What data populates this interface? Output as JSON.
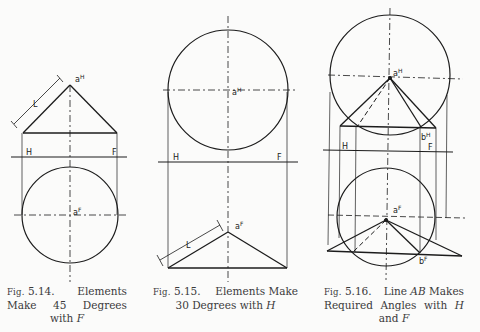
{
  "figures": [
    {
      "id": "5.14",
      "caption": {
        "fig_prefix": "Fig.",
        "number": "5.14.",
        "line1_word": "Elements",
        "line2": [
          "Make",
          "45",
          "Degrees"
        ],
        "line3_text": "with",
        "line3_var": "F"
      },
      "labels": {
        "top_point": "a",
        "top_point_sup": "H",
        "bottom_point": "a",
        "bottom_point_sup": "F",
        "ref_left": "H",
        "ref_right": "F",
        "length": "L"
      },
      "geometry": {
        "angle_with": "F",
        "angle_deg": 45
      }
    },
    {
      "id": "5.15",
      "caption": {
        "fig_prefix": "Fig.",
        "number": "5.15.",
        "line1_rest": "Elements Make",
        "line2_text": "30 Degrees with",
        "line2_var": "H"
      },
      "labels": {
        "top_point": "a",
        "top_point_sup": "H",
        "bottom_point": "a",
        "bottom_point_sup": "F",
        "ref_left": "H",
        "ref_right": "F",
        "length": "L"
      },
      "geometry": {
        "angle_with": "H",
        "angle_deg": 30
      }
    },
    {
      "id": "5.16",
      "caption": {
        "fig_prefix": "Fig.",
        "number": "5.16.",
        "line1_a": "Line",
        "line1_var": "AB",
        "line1_b": "Makes",
        "line2": [
          "Required",
          "Angles",
          "with"
        ],
        "line2_var": "H",
        "line3_text": "and",
        "line3_var": "F"
      },
      "labels": {
        "top_point": "a",
        "top_point_sup": "H",
        "top_end": "b",
        "top_end_sup": "H",
        "bottom_point": "a",
        "bottom_point_sup": "F",
        "bottom_end": "b",
        "bottom_end_sup": "F",
        "ref_left": "H",
        "ref_right": "F"
      }
    }
  ]
}
